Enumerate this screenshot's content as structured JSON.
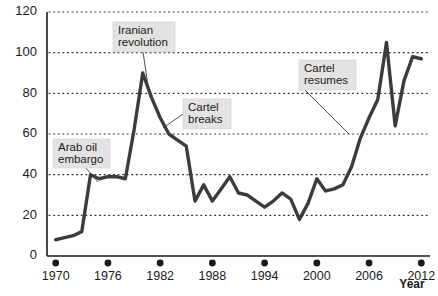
{
  "chart_data": {
    "type": "line",
    "title": "",
    "subtitle": "",
    "xlabel": "Year",
    "ylabel": "",
    "xlim": [
      1969,
      2013
    ],
    "ylim": [
      0,
      120
    ],
    "grid": true,
    "legend": "none",
    "y_ticks": [
      0,
      20,
      40,
      60,
      80,
      100,
      120
    ],
    "x_ticks": [
      1970,
      1976,
      1982,
      1988,
      1994,
      2000,
      2006,
      2012
    ],
    "x_tick_labels": [
      "1970",
      "1976",
      "1982",
      "1988",
      "1994",
      "2000",
      "2006",
      "2012"
    ],
    "series": [
      {
        "name": "Crude oil price",
        "color": "#3c3c3c",
        "x": [
          1970,
          1971,
          1972,
          1973,
          1974,
          1975,
          1976,
          1977,
          1978,
          1979,
          1980,
          1981,
          1982,
          1983,
          1984,
          1985,
          1986,
          1987,
          1988,
          1989,
          1990,
          1991,
          1992,
          1993,
          1994,
          1995,
          1996,
          1997,
          1998,
          1999,
          2000,
          2001,
          2002,
          2003,
          2004,
          2005,
          2006,
          2007,
          2008,
          2009,
          2010,
          2011,
          2012
        ],
        "values": [
          8,
          9,
          10,
          12,
          40,
          38,
          39,
          39,
          38,
          62,
          90,
          78,
          68,
          60,
          57,
          54,
          27,
          35,
          27,
          33,
          39,
          31,
          30,
          27,
          24,
          27,
          31,
          28,
          18,
          26,
          38,
          32,
          33,
          35,
          44,
          58,
          68,
          77,
          105,
          64,
          86,
          98,
          97
        ]
      }
    ],
    "annotations": [
      {
        "id": "arab-oil-embargo",
        "label_line1": "Arab oil",
        "label_line2": "embargo",
        "box_x": 53,
        "box_y": 139,
        "box_w": 57,
        "box_h": 29,
        "leader_from_x": 86,
        "leader_from_y": 168,
        "leader_to_x": 98,
        "leader_to_y": 182
      },
      {
        "id": "iranian-revolution",
        "label_line1": "Iranian",
        "label_line2": "revolution",
        "box_x": 113,
        "box_y": 22,
        "box_w": 62,
        "box_h": 30,
        "leader_from_x": 143,
        "leader_from_y": 52,
        "leader_to_x": 148,
        "leader_to_y": 86
      },
      {
        "id": "cartel-breaks",
        "label_line1": "Cartel",
        "label_line2": "breaks",
        "box_x": 183,
        "box_y": 99,
        "box_w": 48,
        "box_h": 30,
        "leader_from_x": 183,
        "leader_from_y": 114,
        "leader_to_x": 163,
        "leader_to_y": 128
      },
      {
        "id": "cartel-resumes",
        "label_line1": "Cartel",
        "label_line2": "resumes",
        "box_x": 299,
        "box_y": 60,
        "box_w": 57,
        "box_h": 30,
        "leader_from_x": 305,
        "leader_from_y": 90,
        "leader_to_x": 349,
        "leader_to_y": 134
      }
    ]
  },
  "axis": {
    "y_label_0": "0",
    "y_label_20": "20",
    "y_label_40": "40",
    "y_label_60": "60",
    "y_label_80": "80",
    "y_label_100": "100",
    "y_label_120": "120",
    "year_axis_title": "Year"
  }
}
